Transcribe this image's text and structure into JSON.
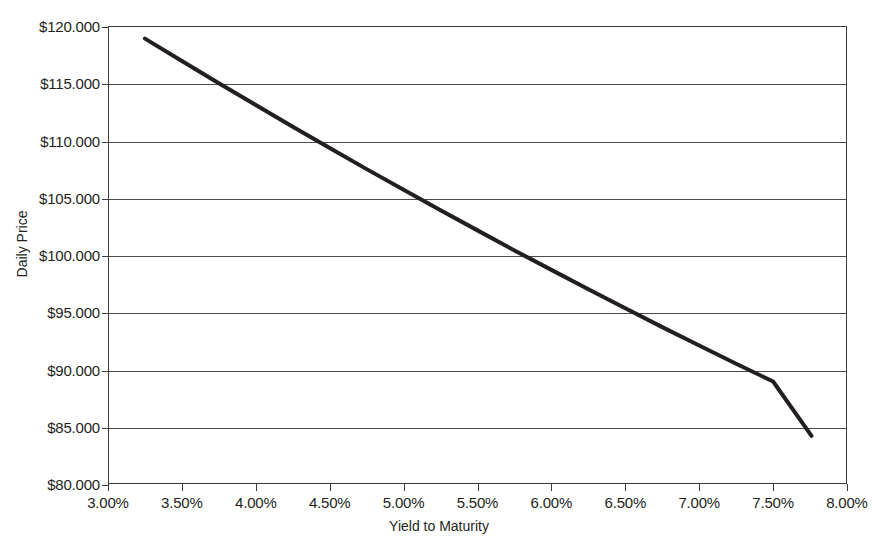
{
  "chart_data": {
    "type": "line",
    "title": "",
    "xlabel": "Yield to Maturity",
    "ylabel": "Daily Price",
    "xlim": [
      3.0,
      8.0
    ],
    "ylim": [
      80.0,
      120.0
    ],
    "grid": "horizontal",
    "legend": "none",
    "x_tick_labels": [
      "3.00%",
      "3.50%",
      "4.00%",
      "4.50%",
      "5.00%",
      "5.50%",
      "6.00%",
      "6.50%",
      "7.00%",
      "7.50%",
      "8.00%"
    ],
    "x_tick_values": [
      3.0,
      3.5,
      4.0,
      4.5,
      5.0,
      5.5,
      6.0,
      6.5,
      7.0,
      7.5,
      8.0
    ],
    "y_tick_labels": [
      "$120.000",
      "$115.000",
      "$110.000",
      "$105.000",
      "$100.000",
      "$95.000",
      "$90.000",
      "$85.000",
      "$80.000"
    ],
    "y_tick_values": [
      120.0,
      115.0,
      110.0,
      105.0,
      100.0,
      95.0,
      90.0,
      85.0,
      80.0
    ],
    "series": [
      {
        "name": "Daily Price",
        "color": "#231f20",
        "line_width": 4,
        "x": [
          3.25,
          3.5,
          3.75,
          4.0,
          4.25,
          4.5,
          4.75,
          5.0,
          5.25,
          5.5,
          5.75,
          6.0,
          6.25,
          6.5,
          6.75,
          7.0,
          7.25,
          7.5,
          7.76
        ],
        "values": [
          118.9,
          116.95,
          115.0,
          113.1,
          111.2,
          109.35,
          107.5,
          105.7,
          103.9,
          102.15,
          100.4,
          98.7,
          97.0,
          95.35,
          93.7,
          92.1,
          90.5,
          88.95,
          84.2
        ]
      }
    ]
  },
  "axes": {
    "y_title": "Daily Price",
    "x_title": "Yield to Maturity"
  }
}
